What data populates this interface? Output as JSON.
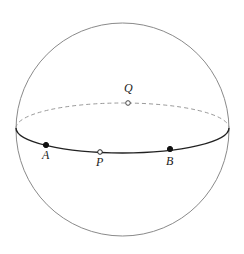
{
  "diagram": {
    "type": "sphere-with-equator",
    "sphere": {
      "cx": 122.5,
      "cy": 129.5,
      "r": 106.5,
      "stroke": "#888888"
    },
    "equator": {
      "cx": 122.5,
      "cy": 128,
      "rx": 106.5,
      "ry": 25,
      "front_stroke": "#222222",
      "back_stroke": "#999999"
    },
    "points": [
      {
        "id": "A",
        "label": "A",
        "x": 46,
        "y": 145,
        "filled": true,
        "label_x": 42,
        "label_y": 159
      },
      {
        "id": "P",
        "label": "P",
        "x": 100,
        "y": 152,
        "filled": false,
        "label_x": 96,
        "label_y": 166
      },
      {
        "id": "B",
        "label": "B",
        "x": 170,
        "y": 149,
        "filled": true,
        "label_x": 166,
        "label_y": 165
      },
      {
        "id": "Q",
        "label": "Q",
        "x": 128,
        "y": 103,
        "filled": false,
        "label_x": 124,
        "label_y": 92
      }
    ]
  }
}
